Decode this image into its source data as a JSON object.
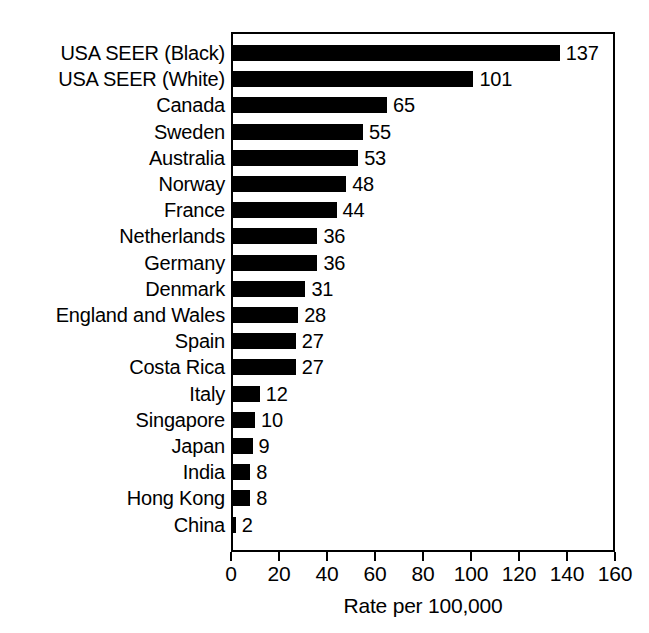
{
  "chart_data": {
    "type": "bar",
    "orientation": "horizontal",
    "title": "",
    "xlabel": "Rate per 100,000",
    "ylabel": "",
    "xlim": [
      0,
      160
    ],
    "xticks": [
      0,
      20,
      40,
      60,
      80,
      100,
      120,
      140,
      160
    ],
    "xtick_labels": [
      "0",
      "20",
      "40",
      "60",
      "80",
      "100",
      "120",
      "140",
      "160"
    ],
    "grid": false,
    "legend": null,
    "bar_color": "#000000",
    "frame_color": "#000000",
    "background": "#ffffff",
    "show_value_labels": true,
    "categories": [
      "USA SEER (Black)",
      "USA SEER (White)",
      "Canada",
      "Sweden",
      "Australia",
      "Norway",
      "France",
      "Netherlands",
      "Germany",
      "Denmark",
      "England and Wales",
      "Spain",
      "Costa Rica",
      "Italy",
      "Singapore",
      "Japan",
      "India",
      "Hong Kong",
      "China"
    ],
    "values": [
      137,
      101,
      65,
      55,
      53,
      48,
      44,
      36,
      36,
      31,
      28,
      27,
      27,
      12,
      10,
      9,
      8,
      8,
      2
    ],
    "value_labels": [
      "137",
      "101",
      "65",
      "55",
      "53",
      "48",
      "44",
      "36",
      "36",
      "31",
      "28",
      "27",
      "27",
      "12",
      "10",
      "9",
      "8",
      "8",
      "2"
    ]
  }
}
